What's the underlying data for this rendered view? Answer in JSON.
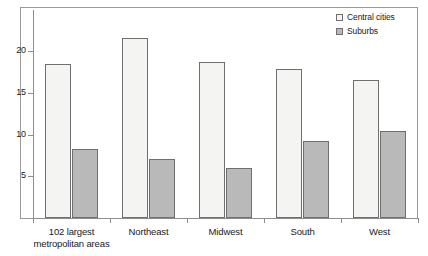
{
  "chart_data": {
    "type": "bar",
    "title": "",
    "subtitle": "",
    "xlabel": "",
    "ylabel": "",
    "ylim": [
      0,
      24.5
    ],
    "yticks": [
      5,
      10,
      15,
      20
    ],
    "ytick_labels": [
      "5",
      "10",
      "15",
      "20"
    ],
    "grid": false,
    "legend_position": "top-right",
    "categories": [
      "102 largest metropolitan areas",
      "Northeast",
      "Midwest",
      "South",
      "West"
    ],
    "category_labels": [
      {
        "line1": "102 largest",
        "line2": "metropolitan areas"
      },
      {
        "line1": "Northeast",
        "line2": ""
      },
      {
        "line1": "Midwest",
        "line2": ""
      },
      {
        "line1": "South",
        "line2": ""
      },
      {
        "line1": "West",
        "line2": ""
      }
    ],
    "series": [
      {
        "name": "Central cities",
        "color": "#f4f4f2",
        "values": [
          18.4,
          21.5,
          18.7,
          17.8,
          16.5
        ]
      },
      {
        "name": "Suburbs",
        "color": "#b9b9b9",
        "values": [
          8.3,
          7.1,
          6.0,
          9.2,
          10.4
        ]
      }
    ]
  },
  "legend": {
    "items": [
      {
        "label": "Central cities",
        "swatch": "legend-swatch-central-cities"
      },
      {
        "label": "Suburbs",
        "swatch": "legend-swatch-suburbs"
      }
    ]
  },
  "colors": {
    "central_cities": "#f4f4f2",
    "suburbs": "#b9b9b9",
    "outline": "#6f6f6f",
    "axis": "#8d8d8d",
    "frame": "#9a9a9a",
    "text": "#1a1a1a"
  }
}
